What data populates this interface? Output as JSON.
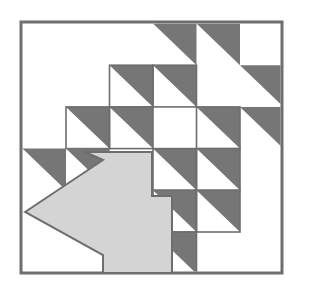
{
  "artwork": {
    "title": "Diagonal tiled square with southwest arrow emblem",
    "kind": "logo-emblem",
    "caption": "",
    "background_color": "#ffffff"
  },
  "frame": {
    "name": "outer-square-frame",
    "x": 21,
    "y": 22,
    "width": 261,
    "height": 251,
    "stroke_color": "#6e6e6e",
    "stroke_width": 3,
    "fill_color": "#ffffff"
  },
  "palette": {
    "dark_gray": "#767676",
    "light_gray": "#d4d4d4",
    "outline_gray": "#6e6e6e",
    "white": "#ffffff",
    "page_background": "#ffffff"
  },
  "grid": {
    "name": "triangle-tile-grid",
    "columns": 6,
    "rows": 6,
    "origin_x": 22.5,
    "origin_y": 23.5,
    "cell_width": 43.5,
    "cell_height": 41.7,
    "triangle_orientation": "upper-right",
    "note": "Tiles follow an anti-diagonal staircase band across the square."
  },
  "tiles": [
    {
      "col": 3,
      "row": 0,
      "fill": "dark",
      "outline": false
    },
    {
      "col": 4,
      "row": 0,
      "fill": "dark",
      "outline": false
    },
    {
      "col": 2,
      "row": 1,
      "fill": "dark",
      "outline": true
    },
    {
      "col": 3,
      "row": 1,
      "fill": "dark",
      "outline": true
    },
    {
      "col": 5,
      "row": 1,
      "fill": "dark",
      "outline": false
    },
    {
      "col": 1,
      "row": 2,
      "fill": "dark",
      "outline": true
    },
    {
      "col": 2,
      "row": 2,
      "fill": "dark",
      "outline": true
    },
    {
      "col": 4,
      "row": 2,
      "fill": "dark",
      "outline": true
    },
    {
      "col": 5,
      "row": 2,
      "fill": "dark",
      "outline": false
    },
    {
      "col": 0,
      "row": 3,
      "fill": "dark",
      "outline": false
    },
    {
      "col": 1,
      "row": 3,
      "fill": "dark",
      "outline": false
    },
    {
      "col": 3,
      "row": 3,
      "fill": "dark",
      "outline": true
    },
    {
      "col": 4,
      "row": 3,
      "fill": "dark",
      "outline": true
    },
    {
      "col": 3,
      "row": 4,
      "fill": "dark",
      "outline": true
    },
    {
      "col": 4,
      "row": 4,
      "fill": "dark",
      "outline": true
    },
    {
      "col": 3,
      "row": 5,
      "fill": "dark",
      "outline": true
    }
  ],
  "arrow": {
    "name": "southwest-arrow",
    "direction": "southwest",
    "fill_color": "#d4d4d4",
    "stroke_color": "#6e6e6e",
    "stroke_width": 2,
    "tip_x": 25,
    "tip_y": 212,
    "points": "25,212 103,160 85,152 152,152 152,196 172,196 172,273 103,273 103,255 25,212"
  }
}
